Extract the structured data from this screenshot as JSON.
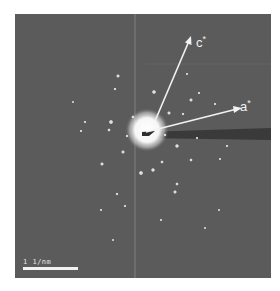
{
  "figure": {
    "type": "selected-area electron diffraction pattern",
    "background_color": "#5b5b5b",
    "axes": [
      {
        "name": "c",
        "label": "c",
        "superscript": "*"
      },
      {
        "name": "a",
        "label": "a",
        "superscript": "*"
      }
    ],
    "scale_bar": {
      "label": "1 1/nm"
    }
  }
}
